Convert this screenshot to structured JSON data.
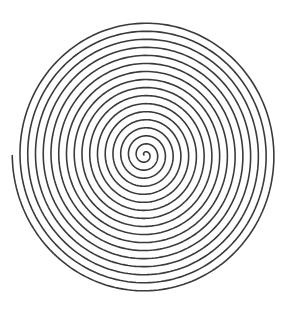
{
  "canvas": {
    "width": 293,
    "height": 314,
    "background_color": "#ffffff",
    "title": "Archimedean Spiral"
  },
  "figure": {
    "name": "spiral",
    "stroke_color": "#3a3a3a",
    "stroke_width": 1.6,
    "fill": "none"
  },
  "chart_data": {
    "type": "line",
    "subtitle": "",
    "xlabel": "",
    "ylabel": "",
    "grid": false,
    "legend": null,
    "axes_visible": false,
    "tick_labels": [],
    "annotations": [],
    "curve": {
      "equation": "r = a + b * theta",
      "parametrization": "x = cx + (a + b*theta) * rx_scale * cos(theta + phase); y = cy + (a + b*theta) * ry_scale * sin(theta + phase)",
      "center_x": 145,
      "center_y": 155,
      "a": 1.0,
      "b": 1.2335,
      "turns": 17,
      "theta_start": 0,
      "theta_end_radians": 106.81,
      "phase_radians": 3.14159,
      "rx_scale": 1.0,
      "ry_scale": 1.038,
      "turn_spacing_px": 7.75,
      "max_radius_x": 133,
      "max_radius_y": 138,
      "samples": 3200,
      "direction": "counterclockwise-outward",
      "endpoint_x": 280,
      "endpoint_y": 157,
      "startpoint_x": 144,
      "startpoint_y": 155,
      "bounds": {
        "left": 13,
        "right": 280,
        "top": 17,
        "bottom": 293
      }
    }
  }
}
